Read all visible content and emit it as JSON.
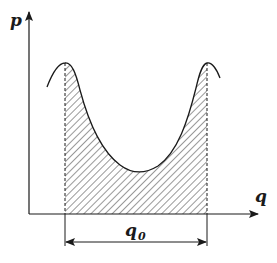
{
  "diagram": {
    "axes": {
      "y_label": "p",
      "x_label": "q"
    },
    "dimension": {
      "label": "q",
      "subscript": "0"
    },
    "colors": {
      "line": "#1a1a1a",
      "hatch": "#444444",
      "background": "#ffffff"
    }
  }
}
